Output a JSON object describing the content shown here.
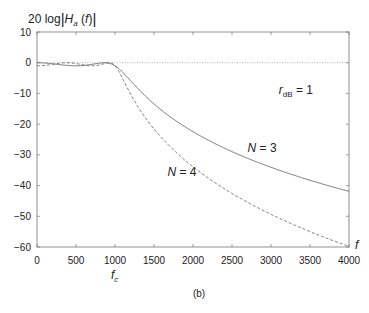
{
  "chart_data": {
    "type": "line",
    "title": "",
    "ylabel": "20 log|H_a(f)|",
    "xlabel": "f",
    "caption": "(b)",
    "xlim": [
      0,
      4000
    ],
    "ylim": [
      -60,
      10
    ],
    "xticks": [
      0,
      500,
      1000,
      1500,
      2000,
      2500,
      3000,
      3500,
      4000
    ],
    "yticks": [
      10,
      0,
      -10,
      -20,
      -30,
      -40,
      -50,
      -60
    ],
    "xtick_labels": [
      "0",
      "500",
      "1000",
      "1500",
      "2000",
      "2500",
      "3000",
      "3500",
      "4000"
    ],
    "ytick_labels": [
      "10",
      "0",
      "−10",
      "−20",
      "−30",
      "−40",
      "−50",
      "−60"
    ],
    "grid": false,
    "reference_line": {
      "y": 0,
      "style": "dotted"
    },
    "annotations": [
      {
        "text": "r_dB = 1",
        "x": 3100,
        "y": -9
      },
      {
        "text": "N = 3",
        "x": 2700,
        "y": -29
      },
      {
        "text": "N = 4",
        "x": 1800,
        "y": -37
      },
      {
        "text": "f_c",
        "x": 1000,
        "y": -66
      },
      {
        "text": "f",
        "x": 4050,
        "y": -59
      }
    ],
    "x": [
      0,
      250,
      500,
      750,
      1000,
      1250,
      1500,
      2000,
      2500,
      3000,
      3500,
      4000
    ],
    "series": [
      {
        "name": "N = 3",
        "style": "solid",
        "values": [
          0.0,
          -0.6,
          -1.0,
          -0.4,
          -1.0,
          -7.2,
          -13.4,
          -22.5,
          -28.9,
          -34.0,
          -38.3,
          -41.9
        ]
      },
      {
        "name": "N = 4",
        "style": "dashed",
        "values": [
          -1.0,
          -0.1,
          -0.4,
          -0.6,
          -1.0,
          -12.5,
          -21.6,
          -33.9,
          -42.5,
          -49.4,
          -55.0,
          -59.8
        ]
      }
    ]
  }
}
